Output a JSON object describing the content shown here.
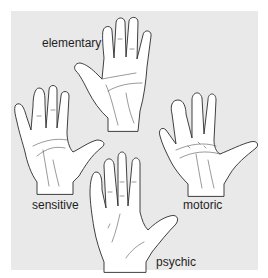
{
  "figure": {
    "background_color": "#e9e9e9",
    "hands": [
      {
        "id": "elementary",
        "label": "elementary"
      },
      {
        "id": "sensitive",
        "label": "sensitive"
      },
      {
        "id": "motoric",
        "label": "motoric"
      },
      {
        "id": "psychic",
        "label": "psychic"
      }
    ]
  }
}
